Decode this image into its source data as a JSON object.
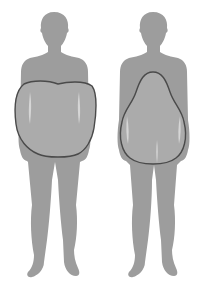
{
  "diagram": {
    "type": "body-shape-comparison",
    "figures": [
      {
        "id": "left",
        "shape": "apple",
        "outline_shape": "rounded-heart"
      },
      {
        "id": "right",
        "shape": "pear",
        "outline_shape": "pear"
      }
    ],
    "colors": {
      "background": "#ffffff",
      "silhouette": "#9d9d9d",
      "overlay_fill": "#ababab",
      "overlay_stroke": "#4a4a4a",
      "highlight": "#d6d6d6"
    }
  }
}
